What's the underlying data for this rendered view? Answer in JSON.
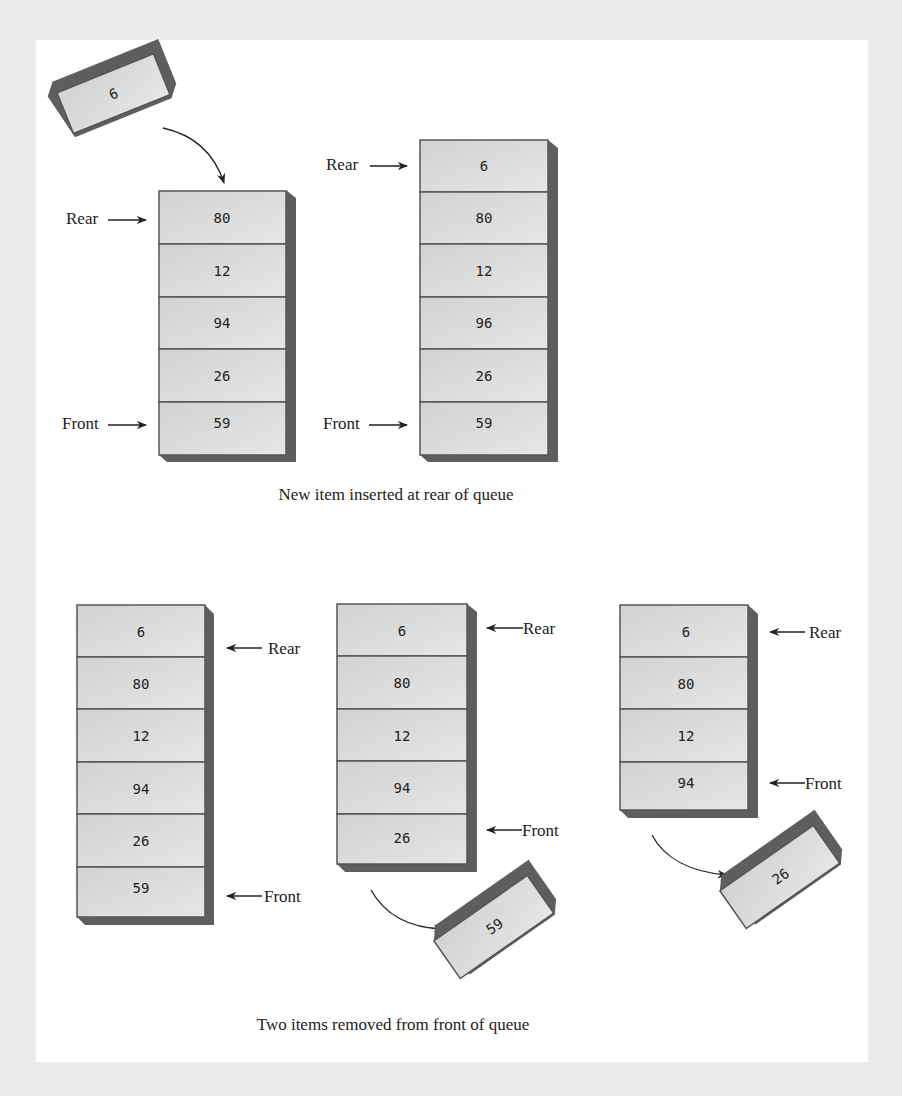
{
  "figure": {
    "top_section": {
      "caption": "New item inserted at rear of queue",
      "incoming_item": "6",
      "before": {
        "items": [
          "80",
          "12",
          "94",
          "26",
          "59"
        ],
        "rear_label": "Rear",
        "front_label": "Front"
      },
      "after": {
        "items": [
          "6",
          "80",
          "12",
          "96",
          "26",
          "59"
        ],
        "rear_label": "Rear",
        "front_label": "Front"
      }
    },
    "bottom_section": {
      "caption": "Two items removed from front of queue",
      "queue_1": {
        "items": [
          "6",
          "80",
          "12",
          "94",
          "26",
          "59"
        ],
        "rear_label": "Rear",
        "front_label": "Front"
      },
      "queue_2": {
        "items": [
          "6",
          "80",
          "12",
          "94",
          "26"
        ],
        "rear_label": "Rear",
        "front_label": "Front",
        "removed_item": "59"
      },
      "queue_3": {
        "items": [
          "6",
          "80",
          "12",
          "94"
        ],
        "rear_label": "Rear",
        "front_label": "Front",
        "removed_item": "26"
      }
    }
  },
  "colors": {
    "cell_fill": "#d9d9d9",
    "cell_border": "#555555",
    "shadow": "#5e5e5e",
    "background": "#ffffff",
    "frame": "#ebebeb"
  }
}
